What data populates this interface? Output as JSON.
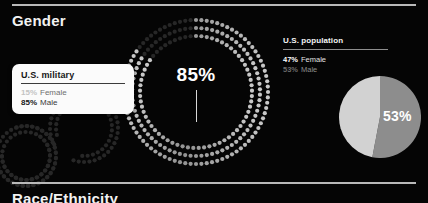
{
  "section": {
    "title": "Gender",
    "next_title": "Race/Ethnicity"
  },
  "donut": {
    "center_value": "85%",
    "filled_pct": 85,
    "dim_pct": 15,
    "rings": 3,
    "colors": {
      "filled": "#c9c9c9",
      "dim": "#272727"
    }
  },
  "tooltip": {
    "title": "U.S. military",
    "rows": [
      {
        "pct": "15%",
        "label": "Female",
        "emphasis": "muted"
      },
      {
        "pct": "85%",
        "label": "Male",
        "emphasis": "strong"
      }
    ]
  },
  "legend": {
    "title": "U.S. population",
    "rows": [
      {
        "pct": "47%",
        "label": "Female",
        "emphasis": "bright"
      },
      {
        "pct": "53%",
        "label": "Male",
        "emphasis": "dim"
      }
    ]
  },
  "chart_data": [
    {
      "type": "pie",
      "title": "U.S. military",
      "categories": [
        "Male",
        "Female"
      ],
      "values": [
        85,
        15
      ],
      "value_labels": [
        "85%",
        "15%"
      ],
      "colors": [
        "#c9c9c9",
        "#272727"
      ],
      "render": "dotted-donut",
      "center_label": "85%",
      "legend": "tooltip"
    },
    {
      "type": "pie",
      "title": "U.S. population",
      "categories": [
        "Male",
        "Female"
      ],
      "values": [
        53,
        47
      ],
      "value_labels": [
        "53%",
        "47%"
      ],
      "colors": [
        "#8d8d8d",
        "#d2d2d2"
      ],
      "render": "solid-pie",
      "slice_label": "53%",
      "legend": "right"
    }
  ]
}
